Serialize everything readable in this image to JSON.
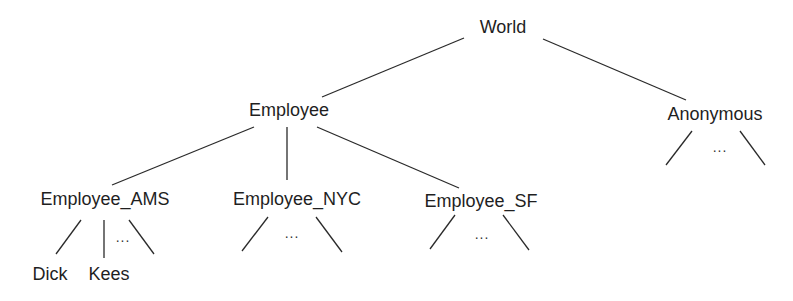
{
  "diagram": {
    "type": "tree",
    "root": "World",
    "nodes": {
      "world": "World",
      "employee": "Employee",
      "anonymous": "Anonymous",
      "employee_ams": "Employee_AMS",
      "employee_nyc": "Employee_NYC",
      "employee_sf": "Employee_SF",
      "dick": "Dick",
      "kees": "Kees"
    },
    "ellipsis": "...",
    "edges": [
      [
        "World",
        "Employee"
      ],
      [
        "World",
        "Anonymous"
      ],
      [
        "Employee",
        "Employee_AMS"
      ],
      [
        "Employee",
        "Employee_NYC"
      ],
      [
        "Employee",
        "Employee_SF"
      ],
      [
        "Employee_AMS",
        "Dick"
      ],
      [
        "Employee_AMS",
        "Kees"
      ],
      [
        "Employee_AMS",
        "..."
      ],
      [
        "Employee_NYC",
        "..."
      ],
      [
        "Employee_SF",
        "..."
      ],
      [
        "Anonymous",
        "..."
      ]
    ]
  }
}
